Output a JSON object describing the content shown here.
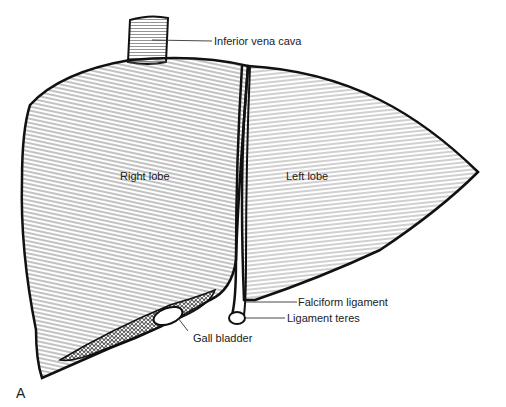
{
  "figure": {
    "panel_letter": "A"
  },
  "labels": {
    "ivc": "Inferior vena cava",
    "right_lobe": "Right lobe",
    "left_lobe": "Left lobe",
    "falciform": "Falciform ligament",
    "ligament_teres": "Ligament teres",
    "gall_bladder": "Gall bladder"
  },
  "colors": {
    "outline": "#111111",
    "hatch": "#555555",
    "background": "#ffffff",
    "text": "#222222"
  }
}
